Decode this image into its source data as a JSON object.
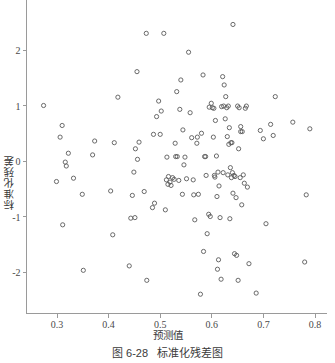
{
  "caption": {
    "number": "图 6-28",
    "title": "标准化残差图"
  },
  "chart_data": {
    "type": "scatter",
    "title": "标准化残差图",
    "xlabel": "预测值",
    "ylabel": "标准化残差",
    "xlim": [
      0.258,
      0.815
    ],
    "ylim": [
      -2.62,
      2.62
    ],
    "xticks": [
      0.3,
      0.4,
      0.5,
      0.6,
      0.7,
      0.8
    ],
    "xtick_labels": [
      "0.3",
      "0.4",
      "0.5",
      "0.6",
      "0.7",
      "0.8"
    ],
    "yticks": [
      2,
      1,
      0,
      -1,
      -2
    ],
    "ytick_labels": [
      "2",
      "1",
      "0",
      "-1",
      "-2"
    ],
    "grid": false,
    "legend": null,
    "marker": "open-circle",
    "marker_color": "#5a5a5a",
    "marker_size": 3.2,
    "n_points": 145,
    "points": [
      [
        0.274,
        1.0
      ],
      [
        0.31,
        0.64
      ],
      [
        0.306,
        0.43
      ],
      [
        0.322,
        0.14
      ],
      [
        0.316,
        -0.02
      ],
      [
        0.318,
        -0.09
      ],
      [
        0.299,
        -0.37
      ],
      [
        0.332,
        -0.31
      ],
      [
        0.349,
        -0.6
      ],
      [
        0.311,
        -1.15
      ],
      [
        0.373,
        0.36
      ],
      [
        0.369,
        0.11
      ],
      [
        0.351,
        -1.97
      ],
      [
        0.408,
        -1.33
      ],
      [
        0.418,
        1.15
      ],
      [
        0.411,
        0.33
      ],
      [
        0.404,
        -0.54
      ],
      [
        0.44,
        -1.89
      ],
      [
        0.455,
        1.61
      ],
      [
        0.459,
        0.34
      ],
      [
        0.452,
        0.22
      ],
      [
        0.456,
        0.03
      ],
      [
        0.449,
        -0.2
      ],
      [
        0.446,
        -0.62
      ],
      [
        0.443,
        -1.03
      ],
      [
        0.451,
        -1.02
      ],
      [
        0.473,
        2.3
      ],
      [
        0.469,
        -0.55
      ],
      [
        0.474,
        -2.15
      ],
      [
        0.485,
        -0.84
      ],
      [
        0.489,
        -0.76
      ],
      [
        0.497,
        1.08
      ],
      [
        0.493,
        0.8
      ],
      [
        0.5,
        0.48
      ],
      [
        0.502,
        0.9
      ],
      [
        0.507,
        2.3
      ],
      [
        0.51,
        -0.88
      ],
      [
        0.513,
        0.07
      ],
      [
        0.516,
        -0.28
      ],
      [
        0.512,
        -0.34
      ],
      [
        0.519,
        -0.38
      ],
      [
        0.515,
        -0.42
      ],
      [
        0.521,
        -0.44
      ],
      [
        0.524,
        -0.3
      ],
      [
        0.527,
        -0.33
      ],
      [
        0.532,
        1.25
      ],
      [
        0.529,
        0.32
      ],
      [
        0.533,
        0.08
      ],
      [
        0.536,
        -0.35
      ],
      [
        0.54,
        1.46
      ],
      [
        0.538,
        0.93
      ],
      [
        0.544,
        0.56
      ],
      [
        0.548,
        0.07
      ],
      [
        0.546,
        -0.07
      ],
      [
        0.543,
        -0.6
      ],
      [
        0.551,
        -0.32
      ],
      [
        0.555,
        1.96
      ],
      [
        0.558,
        0.87
      ],
      [
        0.561,
        0.42
      ],
      [
        0.564,
        -0.34
      ],
      [
        0.567,
        -1.06
      ],
      [
        0.571,
        0.32
      ],
      [
        0.574,
        -0.6
      ],
      [
        0.578,
        -2.4
      ],
      [
        0.583,
        1.55
      ],
      [
        0.58,
        0.5
      ],
      [
        0.586,
        0.08
      ],
      [
        0.589,
        -0.26
      ],
      [
        0.584,
        -1.63
      ],
      [
        0.591,
        -1.31
      ],
      [
        0.594,
        -0.96
      ],
      [
        0.597,
        -1.0
      ],
      [
        0.599,
        1.04
      ],
      [
        0.595,
        0.97
      ],
      [
        0.601,
        0.96
      ],
      [
        0.604,
        0.95
      ],
      [
        0.607,
        0.73
      ],
      [
        0.603,
        0.43
      ],
      [
        0.609,
        0.09
      ],
      [
        0.612,
        -0.2
      ],
      [
        0.606,
        -0.29
      ],
      [
        0.614,
        -0.45
      ],
      [
        0.61,
        -0.64
      ],
      [
        0.616,
        -1.02
      ],
      [
        0.613,
        -1.78
      ],
      [
        0.611,
        -1.95
      ],
      [
        0.618,
        -2.13
      ],
      [
        0.621,
        1.52
      ],
      [
        0.624,
        1.37
      ],
      [
        0.627,
        1.16
      ],
      [
        0.619,
        0.98
      ],
      [
        0.623,
        0.99
      ],
      [
        0.629,
        0.96
      ],
      [
        0.632,
        0.99
      ],
      [
        0.626,
        0.76
      ],
      [
        0.634,
        0.6
      ],
      [
        0.63,
        0.44
      ],
      [
        0.637,
        0.33
      ],
      [
        0.633,
        0.3
      ],
      [
        0.636,
        -0.12
      ],
      [
        0.64,
        -0.21
      ],
      [
        0.631,
        -0.25
      ],
      [
        0.643,
        -0.26
      ],
      [
        0.638,
        -0.3
      ],
      [
        0.645,
        -0.28
      ],
      [
        0.641,
        -0.58
      ],
      [
        0.647,
        -0.66
      ],
      [
        0.635,
        -1.04
      ],
      [
        0.644,
        -1.67
      ],
      [
        0.648,
        -1.7
      ],
      [
        0.65,
        0.99
      ],
      [
        0.653,
        0.96
      ],
      [
        0.656,
        0.62
      ],
      [
        0.659,
        0.53
      ],
      [
        0.652,
        0.22
      ],
      [
        0.661,
        -0.25
      ],
      [
        0.655,
        -0.3
      ],
      [
        0.663,
        -0.4
      ],
      [
        0.658,
        -0.79
      ],
      [
        0.651,
        -2.15
      ],
      [
        0.667,
        0.99
      ],
      [
        0.665,
        0.95
      ],
      [
        0.669,
        -0.47
      ],
      [
        0.672,
        -1.85
      ],
      [
        0.686,
        -2.38
      ],
      [
        0.694,
        0.55
      ],
      [
        0.7,
        0.4
      ],
      [
        0.705,
        -1.13
      ],
      [
        0.714,
        0.66
      ],
      [
        0.719,
        0.46
      ],
      [
        0.723,
        1.16
      ],
      [
        0.641,
        2.46
      ],
      [
        0.757,
        0.7
      ],
      [
        0.78,
        -1.82
      ],
      [
        0.783,
        -0.61
      ],
      [
        0.79,
        0.58
      ],
      [
        0.565,
        -0.61
      ],
      [
        0.487,
        0.48
      ],
      [
        0.572,
        0.43
      ],
      [
        0.588,
        0.08
      ],
      [
        0.605,
        -0.26
      ],
      [
        0.622,
        -0.21
      ],
      [
        0.639,
        0.33
      ],
      [
        0.656,
        0.53
      ],
      [
        0.53,
        0.08
      ]
    ]
  },
  "axes": {
    "x_axis_name": "predicted-value-axis",
    "y_axis_name": "standardized-residual-axis"
  }
}
